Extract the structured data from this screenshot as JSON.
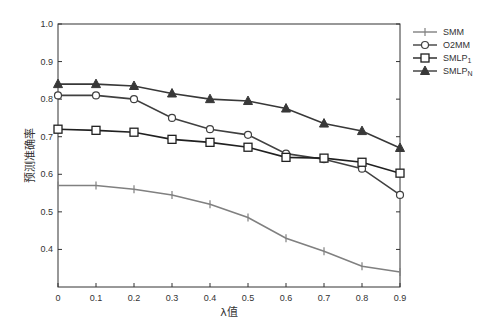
{
  "chart_data": {
    "type": "line",
    "title": "",
    "xlabel": "λ值",
    "ylabel": "预测准确率",
    "x": [
      0,
      0.1,
      0.2,
      0.3,
      0.4,
      0.5,
      0.6,
      0.7,
      0.8,
      0.9
    ],
    "x_tick_labels": [
      "0",
      "0.1",
      "0.2",
      "0.3",
      "0.4",
      "0.5",
      "0.6",
      "0.7",
      "0.8",
      "0.9"
    ],
    "y_tick_labels": [
      "0.4",
      "0.5",
      "0.6",
      "0.7",
      "0.8",
      "0.9",
      "1.0"
    ],
    "xlim": [
      0,
      0.9
    ],
    "ylim": [
      0.3,
      1.0
    ],
    "grid": false,
    "legend_position": "outside-right-top",
    "series": [
      {
        "name": "SMM",
        "marker": "plus",
        "color": "#808080",
        "values": [
          0.57,
          0.57,
          0.56,
          0.545,
          0.52,
          0.485,
          0.43,
          0.395,
          0.355,
          0.34
        ]
      },
      {
        "name": "O2MM",
        "marker": "circle",
        "color": "#404040",
        "values": [
          0.81,
          0.81,
          0.8,
          0.75,
          0.72,
          0.705,
          0.655,
          0.64,
          0.615,
          0.545
        ]
      },
      {
        "name": "SMLP1",
        "marker": "square",
        "color": "#202020",
        "values": [
          0.72,
          0.717,
          0.712,
          0.693,
          0.685,
          0.672,
          0.645,
          0.643,
          0.632,
          0.603
        ]
      },
      {
        "name": "SMLPN",
        "marker": "triangle",
        "color": "#383838",
        "values": [
          0.84,
          0.84,
          0.835,
          0.815,
          0.8,
          0.795,
          0.775,
          0.735,
          0.715,
          0.67
        ]
      }
    ]
  },
  "legend": {
    "items": [
      {
        "label": "SMM",
        "sub": ""
      },
      {
        "label": "O2MM",
        "sub": ""
      },
      {
        "label": "SMLP",
        "sub": "1"
      },
      {
        "label": "SMLP",
        "sub": "N"
      }
    ]
  }
}
